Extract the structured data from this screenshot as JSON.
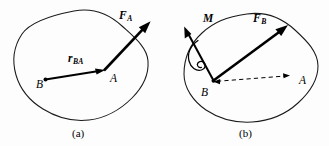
{
  "figure": {
    "background_color": "#fdfdfd",
    "stroke_color": "#000000",
    "outline_color": "#1a1a1a",
    "panels": [
      {
        "id": "a",
        "caption": "(a)",
        "caption_x": 72,
        "caption_y": 137,
        "description": "Rigid body with force F_A applied at point A and position vector r_BA from B to A",
        "points": [
          {
            "label": "B",
            "x": 36,
            "y": 84,
            "dot_x": 45.5,
            "dot_y": 79.5
          },
          {
            "label": "A",
            "x": 112,
            "y": 80,
            "dot_x": 106,
            "dot_y": 70
          }
        ],
        "vectors": [
          {
            "name": "r_BA",
            "symbol": "r",
            "subscript": "BA",
            "label_x": 68,
            "label_y": 62,
            "sub_dx": 7.2,
            "sub_dy": 2.4,
            "type": "position",
            "style": "solid",
            "from_x": 45.5,
            "from_y": 79.5,
            "to_x": 104.5,
            "to_y": 70.0
          },
          {
            "name": "F_A",
            "symbol": "F",
            "subscript": "A",
            "label_x": 119,
            "label_y": 19,
            "sub_dx": 7.4,
            "sub_dy": 2.4,
            "type": "force",
            "style": "solid",
            "from_x": 104.0,
            "from_y": 70.5,
            "to_x": 150.0,
            "to_y": 22.0
          }
        ]
      },
      {
        "id": "b",
        "caption": "(b)",
        "caption_x": 239,
        "caption_y": 137,
        "description": "Equivalent system: force F_B applied at B plus couple moment M; dashed reference line B to A",
        "points": [
          {
            "label": "B",
            "x": 201,
            "y": 93,
            "dot_x": 213,
            "dot_y": 81
          },
          {
            "label": "A",
            "x": 301,
            "y": 83,
            "dot_x": 290,
            "dot_y": 76
          }
        ],
        "vectors": [
          {
            "name": "M",
            "symbol": "M",
            "subscript": "",
            "label_x": 205,
            "label_y": 22,
            "sub_dx": 0,
            "sub_dy": 0,
            "type": "moment",
            "style": "solid",
            "from_x": 213.0,
            "from_y": 81.0,
            "to_x": 184.0,
            "to_y": 27.0
          },
          {
            "name": "F_B",
            "symbol": "F",
            "subscript": "B",
            "label_x": 255,
            "label_y": 22,
            "sub_dx": 7.4,
            "sub_dy": 2.4,
            "type": "force",
            "style": "solid",
            "from_x": 213.0,
            "from_y": 81.0,
            "to_x": 287.0,
            "to_y": 25.0
          },
          {
            "name": "BA-reference",
            "symbol": "",
            "subscript": "",
            "label_x": 0,
            "label_y": 0,
            "sub_dx": 0,
            "sub_dy": 0,
            "type": "reference",
            "style": "dashed",
            "from_x": 214.0,
            "from_y": 82.0,
            "to_x": 289.0,
            "to_y": 76.0
          }
        ],
        "curl": {
          "name": "moment-curl",
          "description": "double-loop curl around M arrow shaft indicating sense of rotation"
        }
      }
    ]
  }
}
